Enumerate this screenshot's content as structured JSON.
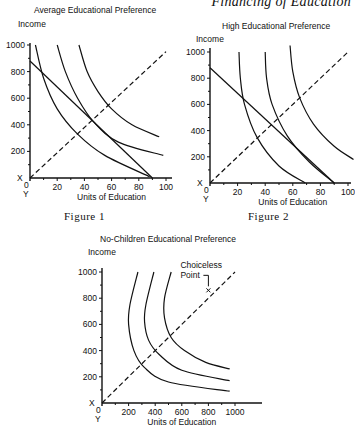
{
  "page": {
    "running_header": "Financing of Education"
  },
  "chart_data": [
    {
      "type": "line",
      "title": "Average Educational Preference",
      "figure_label": "Figure 1",
      "xlabel": "Units of Education",
      "ylabel": "Income",
      "xlim": [
        0,
        100
      ],
      "ylim": [
        0,
        1000
      ],
      "x_ticks": [
        "20",
        "40",
        "60",
        "80",
        "100"
      ],
      "y_ticks": [
        "200",
        "400",
        "600",
        "800",
        "1000"
      ],
      "origin_labels": {
        "x_axis_marker": "X",
        "origin": "0",
        "y_marker": "Y"
      },
      "series": [
        {
          "name": "budget line",
          "style": "solid",
          "points": [
            [
              0,
              880
            ],
            [
              90,
              0
            ]
          ]
        },
        {
          "name": "indifference curve 1",
          "style": "solid",
          "points": [
            [
              4,
              1000
            ],
            [
              10,
              750
            ],
            [
              20,
              520
            ],
            [
              35,
              330
            ],
            [
              55,
              170
            ],
            [
              88,
              10
            ]
          ]
        },
        {
          "name": "indifference curve 2",
          "style": "solid",
          "points": [
            [
              20,
              1000
            ],
            [
              26,
              800
            ],
            [
              35,
              600
            ],
            [
              47,
              420
            ],
            [
              65,
              270
            ],
            [
              98,
              170
            ]
          ]
        },
        {
          "name": "indifference curve 3",
          "style": "solid",
          "points": [
            [
              36,
              1000
            ],
            [
              42,
              800
            ],
            [
              50,
              650
            ],
            [
              60,
              520
            ],
            [
              75,
              400
            ],
            [
              95,
              310
            ]
          ]
        },
        {
          "name": "45-degree line",
          "style": "dashed",
          "points": [
            [
              0,
              0
            ],
            [
              100,
              950
            ]
          ]
        }
      ]
    },
    {
      "type": "line",
      "title": "High Educational Preference",
      "figure_label": "Figure 2",
      "xlabel": "Units of Education",
      "ylabel": "Income",
      "xlim": [
        0,
        100
      ],
      "ylim": [
        0,
        1000
      ],
      "x_ticks": [
        "20",
        "40",
        "60",
        "80",
        "100"
      ],
      "y_ticks": [
        "200",
        "400",
        "600",
        "800",
        "1000"
      ],
      "origin_labels": {
        "x_axis_marker": "X",
        "origin": "0",
        "y_marker": "Y"
      },
      "series": [
        {
          "name": "budget line",
          "style": "solid",
          "points": [
            [
              0,
              880
            ],
            [
              90,
              0
            ]
          ]
        },
        {
          "name": "indifference curve 1",
          "style": "solid",
          "points": [
            [
              21,
              1000
            ],
            [
              22,
              800
            ],
            [
              25,
              600
            ],
            [
              34,
              350
            ],
            [
              50,
              130
            ],
            [
              69,
              0
            ]
          ]
        },
        {
          "name": "indifference curve 2",
          "style": "solid",
          "points": [
            [
              40,
              1000
            ],
            [
              41,
              800
            ],
            [
              45,
              600
            ],
            [
              56,
              360
            ],
            [
              72,
              160
            ],
            [
              90,
              0
            ]
          ]
        },
        {
          "name": "indifference curve 3",
          "style": "solid",
          "points": [
            [
              58,
              1050
            ],
            [
              60,
              850
            ],
            [
              65,
              650
            ],
            [
              75,
              450
            ],
            [
              90,
              280
            ],
            [
              104,
              180
            ]
          ]
        },
        {
          "name": "45-degree line",
          "style": "dashed",
          "points": [
            [
              0,
              0
            ],
            [
              100,
              1000
            ]
          ]
        }
      ]
    },
    {
      "type": "line",
      "title": "No-Children Educational Preference",
      "figure_label": "",
      "xlabel": "Units of Education",
      "ylabel": "Income",
      "xlim": [
        0,
        1200
      ],
      "ylim": [
        0,
        1000
      ],
      "x_ticks": [
        "200",
        "400",
        "600",
        "800",
        "1000"
      ],
      "y_ticks": [
        "200",
        "400",
        "600",
        "800",
        "1000"
      ],
      "origin_labels": {
        "x_axis_marker": "X",
        "origin": "0",
        "y_marker": "Y"
      },
      "annotations": [
        {
          "text": "Choiceless Point",
          "x": 800,
          "y": 860,
          "marker": "x"
        }
      ],
      "series": [
        {
          "name": "indifference curve 1",
          "style": "solid",
          "points": [
            [
              270,
              1000
            ],
            [
              210,
              750
            ],
            [
              200,
              600
            ],
            [
              240,
              400
            ],
            [
              320,
              270
            ],
            [
              500,
              160
            ],
            [
              960,
              90
            ]
          ]
        },
        {
          "name": "indifference curve 2",
          "style": "solid",
          "points": [
            [
              390,
              1000
            ],
            [
              330,
              750
            ],
            [
              320,
              620
            ],
            [
              350,
              480
            ],
            [
              430,
              370
            ],
            [
              600,
              250
            ],
            [
              960,
              170
            ]
          ]
        },
        {
          "name": "indifference curve 3",
          "style": "solid",
          "points": [
            [
              520,
              1000
            ],
            [
              470,
              800
            ],
            [
              470,
              650
            ],
            [
              520,
              500
            ],
            [
              620,
              400
            ],
            [
              780,
              310
            ],
            [
              960,
              260
            ]
          ]
        },
        {
          "name": "45-degree line",
          "style": "dashed",
          "points": [
            [
              0,
              0
            ],
            [
              1000,
              1000
            ]
          ]
        }
      ]
    }
  ]
}
